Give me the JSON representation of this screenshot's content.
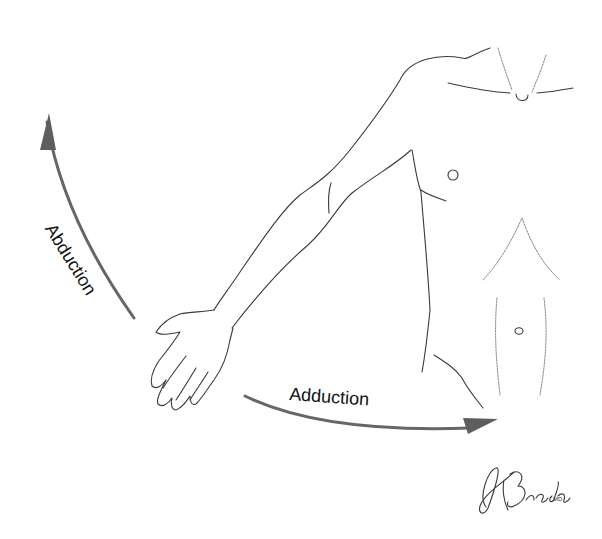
{
  "diagram": {
    "labels": {
      "abduction": "Abduction",
      "adduction": "Adduction"
    },
    "signature": {
      "name": "Brada",
      "suffix": "MD"
    },
    "colors": {
      "line": "#3a3a3a",
      "arrow": "#666666",
      "background": "#ffffff"
    }
  }
}
